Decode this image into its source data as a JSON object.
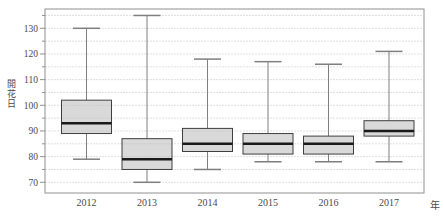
{
  "chart_data": {
    "type": "boxplot",
    "title": "",
    "ylabel": "開花日",
    "xlabel": "年",
    "categories": [
      "2012",
      "2013",
      "2014",
      "2015",
      "2016",
      "2017"
    ],
    "y_ticks": [
      70,
      80,
      90,
      100,
      110,
      120,
      130
    ],
    "y_minor_step": 5,
    "ylim": [
      66,
      137.5
    ],
    "grid": "dotted horizontal lines every 5 units",
    "legend_position": "none",
    "series": [
      {
        "year": "2012",
        "min": 79,
        "q1": 89,
        "median": 93,
        "q3": 102,
        "max": 130
      },
      {
        "year": "2013",
        "min": 70,
        "q1": 75,
        "median": 79,
        "q3": 87,
        "max": 135
      },
      {
        "year": "2014",
        "min": 75,
        "q1": 82,
        "median": 85,
        "q3": 91,
        "max": 118
      },
      {
        "year": "2015",
        "min": 78,
        "q1": 81,
        "median": 85,
        "q3": 89,
        "max": 117
      },
      {
        "year": "2016",
        "min": 78,
        "q1": 81,
        "median": 85,
        "q3": 88,
        "max": 116
      },
      {
        "year": "2017",
        "min": 78,
        "q1": 88,
        "median": 90,
        "q3": 94,
        "max": 121
      }
    ],
    "colors": {
      "background": "#ffffff",
      "box_fill": "#d9d9d9",
      "box_border": "#3f3f3f",
      "median": "#1a1a1a",
      "whisker": "#7f7f7f",
      "grid": "#bfbfbf",
      "frame": "#909090",
      "text": "#4a4a4a"
    }
  },
  "layout": {
    "frame": {
      "left": 45,
      "right": 424,
      "top": 9,
      "bottom": 193
    },
    "y_of_130": 28.3,
    "px_per_unit": 2.5667,
    "box_centers": [
      86.5,
      147,
      207.5,
      268,
      328.5,
      389
    ],
    "box_width": 50,
    "cap_width": 27,
    "year_label_baseline_y": 206
  }
}
